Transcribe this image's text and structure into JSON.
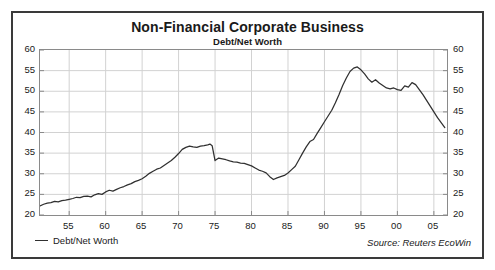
{
  "chart_data": {
    "type": "line",
    "title": "Non-Financial Corporate Business",
    "subtitle": "Debt/Net Worth",
    "xlabel": "",
    "ylabel": "",
    "ylim": [
      20,
      60
    ],
    "yticks": [
      20,
      25,
      30,
      35,
      40,
      45,
      50,
      55,
      60
    ],
    "y_axis_right": true,
    "yticks_right": [
      20,
      25,
      30,
      35,
      40,
      45,
      50,
      55,
      60
    ],
    "xlim": [
      1951.0,
      2006.8
    ],
    "xticks": [
      1955,
      1960,
      1965,
      1970,
      1975,
      1980,
      1985,
      1990,
      1995,
      2000,
      2005
    ],
    "xtick_labels": [
      "55",
      "60",
      "65",
      "70",
      "75",
      "80",
      "85",
      "90",
      "95",
      "00",
      "05"
    ],
    "grid": true,
    "legend_position": "below-left",
    "legend": [
      "Debt/Net Worth"
    ],
    "source_note": "Source: Reuters EcoWin",
    "line_color": "#303030",
    "grid_color": "#d2d2d2",
    "frame_color": "#8a8a8a",
    "border_color": "#3a3a3a",
    "background": "#ffffff",
    "series": [
      {
        "name": "Debt/Net Worth",
        "x": [
          1951.0,
          1951.5,
          1952.0,
          1952.5,
          1953.0,
          1953.5,
          1954.0,
          1954.5,
          1955.0,
          1955.5,
          1956.0,
          1956.5,
          1957.0,
          1957.5,
          1958.0,
          1958.5,
          1959.0,
          1959.5,
          1960.0,
          1960.5,
          1961.0,
          1961.5,
          1962.0,
          1962.5,
          1963.0,
          1963.5,
          1964.0,
          1964.5,
          1965.0,
          1965.5,
          1966.0,
          1966.5,
          1967.0,
          1967.5,
          1968.0,
          1968.5,
          1969.0,
          1969.5,
          1970.0,
          1970.5,
          1971.0,
          1971.5,
          1972.0,
          1972.5,
          1973.0,
          1973.5,
          1974.0,
          1974.3,
          1974.6,
          1975.0,
          1975.5,
          1976.0,
          1976.5,
          1977.0,
          1977.5,
          1978.0,
          1978.5,
          1979.0,
          1979.5,
          1980.0,
          1980.5,
          1981.0,
          1981.5,
          1982.0,
          1982.5,
          1983.0,
          1983.5,
          1984.0,
          1984.5,
          1985.0,
          1985.5,
          1986.0,
          1986.5,
          1987.0,
          1987.5,
          1988.0,
          1988.5,
          1989.0,
          1989.5,
          1990.0,
          1990.5,
          1991.0,
          1991.5,
          1992.0,
          1992.5,
          1993.0,
          1993.5,
          1994.0,
          1994.5,
          1995.0,
          1995.5,
          1996.0,
          1996.5,
          1997.0,
          1997.5,
          1998.0,
          1998.5,
          1999.0,
          1999.5,
          2000.0,
          2000.5,
          2001.0,
          2001.5,
          2002.0,
          2002.5,
          2003.0,
          2003.5,
          2004.0,
          2004.5,
          2005.0,
          2005.5,
          2006.0,
          2006.5
        ],
        "values": [
          22.2,
          22.6,
          22.9,
          23.0,
          23.3,
          23.2,
          23.5,
          23.6,
          23.8,
          24.0,
          24.3,
          24.2,
          24.5,
          24.6,
          24.4,
          24.9,
          25.2,
          25.0,
          25.6,
          26.0,
          25.8,
          26.2,
          26.6,
          26.9,
          27.3,
          27.6,
          28.1,
          28.4,
          28.8,
          29.4,
          30.1,
          30.6,
          31.1,
          31.4,
          32.0,
          32.6,
          33.2,
          34.0,
          34.9,
          35.9,
          36.4,
          36.7,
          36.5,
          36.4,
          36.7,
          36.8,
          37.0,
          37.2,
          36.8,
          33.2,
          33.8,
          33.6,
          33.4,
          33.1,
          32.9,
          32.8,
          32.6,
          32.5,
          32.2,
          31.9,
          31.4,
          30.9,
          30.6,
          30.2,
          29.3,
          28.6,
          29.0,
          29.3,
          29.6,
          30.2,
          31.0,
          31.8,
          33.4,
          35.0,
          36.5,
          37.8,
          38.3,
          39.8,
          41.2,
          42.6,
          44.0,
          45.4,
          47.2,
          49.2,
          51.4,
          53.2,
          54.8,
          55.6,
          55.9,
          55.2,
          54.2,
          53.0,
          52.2,
          52.8,
          52.0,
          51.4,
          50.8,
          50.6,
          50.8,
          50.4,
          50.2,
          51.3,
          51.0,
          52.1,
          51.6,
          50.4,
          49.2,
          47.8,
          46.4,
          45.0,
          43.6,
          42.4,
          41.2
        ]
      }
    ]
  },
  "legend_entry": "Debt/Net Worth",
  "source_note": "Source: Reuters EcoWin"
}
